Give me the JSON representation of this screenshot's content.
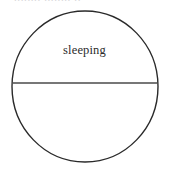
{
  "canvas": {
    "width": 169,
    "height": 170,
    "background_color": "#ffffff"
  },
  "header": {
    "clipped_text": "........  ........ ..",
    "note": "row of text cut off at top edge of image; only faint glyph bottoms visible"
  },
  "diagram": {
    "type": "circle-divided-by-diameter",
    "stroke_color": "#2a2a2a",
    "stroke_width": 1.4,
    "fill_color": "none",
    "circle": {
      "center_x": 85,
      "center_y": 86.5,
      "radius_x": 73,
      "radius_y": 75.5,
      "left": 12,
      "right": 158,
      "top": 11,
      "bottom": 162
    },
    "divider": {
      "orientation": "horizontal",
      "y": 83,
      "x_start": 13,
      "x_end": 157,
      "stroke_color": "#4a4a4a",
      "stroke_width": 1.5
    },
    "regions": [
      {
        "name": "upper-region",
        "label": "sleeping",
        "label_x": 85,
        "label_y": 51,
        "label_color": "#2b2b2b"
      },
      {
        "name": "lower-region",
        "label": "",
        "label_color": "#2b2b2b"
      }
    ]
  }
}
